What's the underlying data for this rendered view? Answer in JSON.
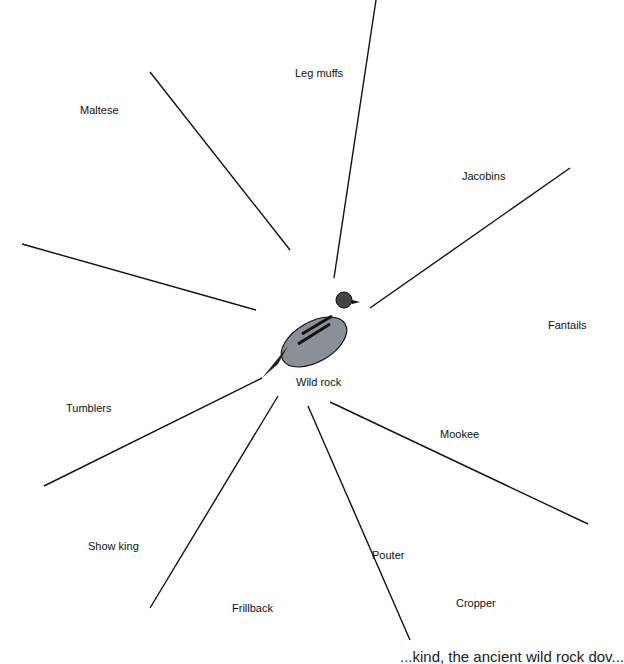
{
  "diagram": {
    "center": {
      "label": "Wild rock"
    },
    "breeds": [
      {
        "label": "Leg muffs"
      },
      {
        "label": "Jacobins"
      },
      {
        "label": "Maltese"
      },
      {
        "label": "Fantails"
      },
      {
        "label": "Tumblers"
      },
      {
        "label": "Mookee"
      },
      {
        "label": "Show king"
      },
      {
        "label": "Pouter"
      },
      {
        "label": "Cropper"
      },
      {
        "label": "Frillback"
      }
    ],
    "footer_text": "...kind, the ancient wild rock dov..."
  }
}
